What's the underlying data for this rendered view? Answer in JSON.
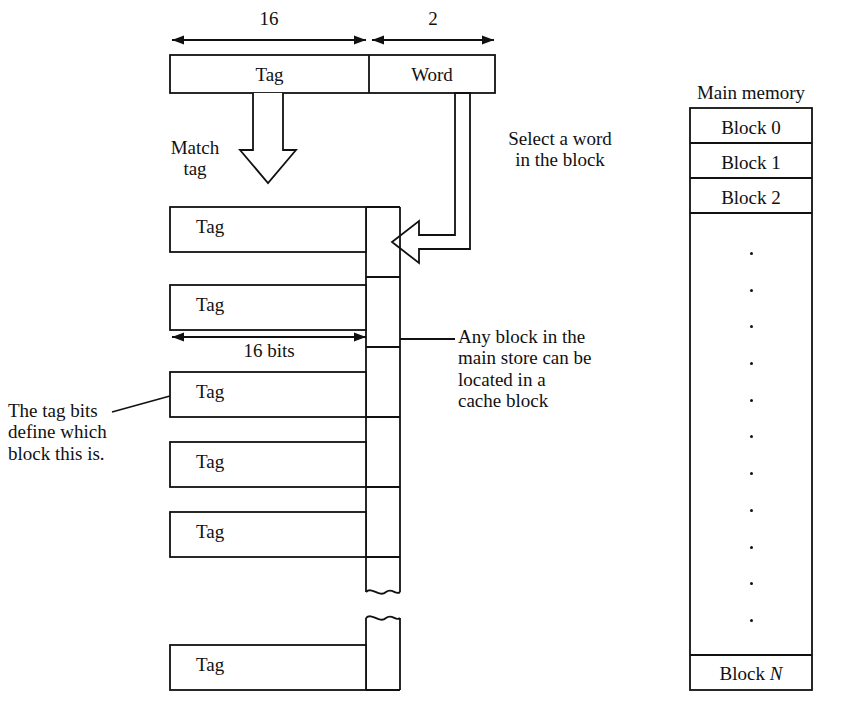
{
  "figure": {
    "address_format": {
      "fields": [
        {
          "label": "Tag",
          "width_bits": "16"
        },
        {
          "label": "Word",
          "width_bits": "2"
        }
      ]
    },
    "annotations": {
      "match_tag": "Match\ntag",
      "select_word": "Select a word\nin the block",
      "any_block": "Any block in the\nmain store can be\nlocated in a\ncache block",
      "tag_bits": "The tag bits\ndefine which\nblock this is.",
      "cache_tag_width": "16 bits"
    },
    "cache": {
      "row_label": "Tag",
      "rows": [
        {
          "label": "Tag"
        },
        {
          "label": "Tag"
        },
        {
          "label": "Tag"
        },
        {
          "label": "Tag"
        },
        {
          "label": "Tag"
        },
        {
          "label": "Tag"
        }
      ]
    },
    "main_memory": {
      "title": "Main memory",
      "blocks": [
        {
          "label": "Block 0"
        },
        {
          "label": "Block 1"
        },
        {
          "label": "Block 2"
        }
      ],
      "ellipsis_count": 11,
      "last_block_prefix": "Block ",
      "last_block_index": "N"
    },
    "colors": {
      "line": "#111111",
      "background": "#ffffff",
      "text": "#111111"
    }
  }
}
